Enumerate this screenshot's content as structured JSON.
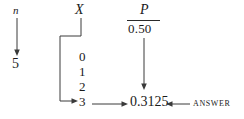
{
  "diagram": {
    "background_color": "#ffffff",
    "ink_color": "#1a1a1a",
    "line_color": "#3a3a3a"
  },
  "columns": {
    "n": {
      "header": "n",
      "value": "5"
    },
    "x": {
      "header": "X",
      "values": [
        "0",
        "1",
        "2",
        "3"
      ],
      "selected_value": "3"
    },
    "p": {
      "header": "P",
      "denominator": "0.50",
      "result": "0.3125"
    }
  },
  "annotations": {
    "answer_label": "ANSWER"
  }
}
